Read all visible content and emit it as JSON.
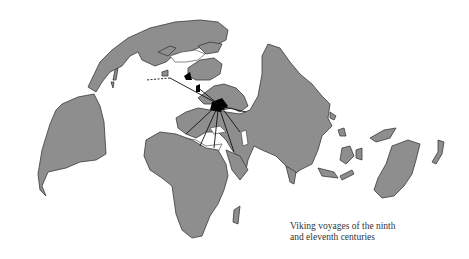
{
  "caption": {
    "line1": "Viking voyages of the ninth",
    "line2": "and eleventh centuries"
  },
  "colors": {
    "land": "#8e8e8e",
    "water": "#ffffff",
    "routes": "#111111",
    "settlements": "#000000"
  },
  "map": {
    "projection": "polar-centered world map",
    "regions": [
      "North America",
      "Greenland",
      "South America",
      "Europe",
      "Scandinavia",
      "Asia",
      "Africa",
      "Arabia",
      "India",
      "Southeast Asia",
      "Australia",
      "New Zealand"
    ]
  }
}
